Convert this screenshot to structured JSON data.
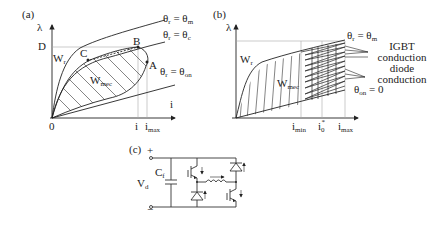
{
  "panel_a": {
    "label": "(a)",
    "y_axis": "λ",
    "x_axis": "i",
    "y_tick": "D",
    "origin": "0",
    "x_ticks": [
      {
        "main": "i",
        "sub": ""
      },
      {
        "main": "i",
        "sub": "max"
      }
    ],
    "region_labels": [
      {
        "main": "W",
        "sub": "r"
      },
      {
        "main": "W",
        "sub": "mec"
      }
    ],
    "points": [
      "A",
      "B",
      "C"
    ],
    "curves": [
      {
        "lhs": "θ",
        "lhs_sub": "r",
        "rhs": "θ",
        "rhs_sub": "m"
      },
      {
        "lhs": "θ",
        "lhs_sub": "r",
        "rhs": "θ",
        "rhs_sub": "c"
      },
      {
        "lhs": "θ",
        "lhs_sub": "r",
        "rhs": "θ",
        "rhs_sub": "on"
      }
    ]
  },
  "panel_b": {
    "label": "(b)",
    "y_axis": "λ",
    "x_ticks": [
      {
        "main": "i",
        "sub": "min"
      },
      {
        "main": "i",
        "sub": "0",
        "sup": "*"
      },
      {
        "main": "i",
        "sub": "max"
      }
    ],
    "region_labels": [
      {
        "main": "W",
        "sub": "r"
      },
      {
        "main": "W",
        "sub": "mec"
      }
    ],
    "curves": [
      {
        "lhs": "θ",
        "lhs_sub": "r",
        "rhs": "θ",
        "rhs_sub": "m"
      },
      {
        "lhs": "θ",
        "lhs_sub": "on",
        "rhs": "0",
        "rhs_sub": ""
      }
    ],
    "annotations": [
      "IGBT",
      "conduction",
      "diode",
      "conduction"
    ]
  },
  "panel_c": {
    "label": "(c)",
    "plus": "+",
    "minus": "−",
    "voltage": {
      "main": "V",
      "sub": "d"
    },
    "capacitor": {
      "main": "C",
      "sub": "f"
    }
  }
}
